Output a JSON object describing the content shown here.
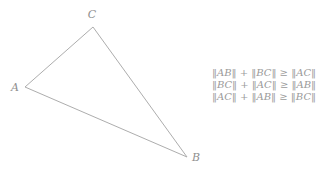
{
  "diagram": {
    "line_color": "#adadad",
    "label_color": "#8f8f8f",
    "vertices": [
      {
        "label": "A",
        "x": 25,
        "y": 87,
        "label_x": 15,
        "label_y": 91
      },
      {
        "label": "B",
        "x": 187,
        "y": 157,
        "label_x": 196,
        "label_y": 161
      },
      {
        "label": "C",
        "x": 93,
        "y": 27,
        "label_x": 92,
        "label_y": 18
      }
    ],
    "edges": [
      [
        "A",
        "C"
      ],
      [
        "C",
        "B"
      ],
      [
        "A",
        "B"
      ]
    ]
  },
  "inequalities": {
    "text_color": "#9a9a9a",
    "lines": [
      "‖AB‖ + ‖BC‖ ≥ ‖AC‖",
      "‖BC‖ + ‖AC‖ ≥ ‖AB‖",
      "‖AC‖ + ‖AB‖ ≥ ‖BC‖"
    ]
  }
}
